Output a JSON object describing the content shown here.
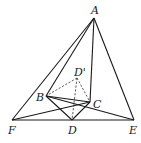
{
  "figure": {
    "type": "geometry-diagram",
    "points": {
      "A": {
        "label": "A",
        "x": 94,
        "y": 18
      },
      "B": {
        "label": "B",
        "x": 46,
        "y": 96
      },
      "C": {
        "label": "C",
        "x": 90,
        "y": 102
      },
      "D_prime": {
        "label": "D'",
        "x": 77,
        "y": 78
      },
      "D": {
        "label": "D",
        "x": 72,
        "y": 120
      },
      "F": {
        "label": "F",
        "x": 12,
        "y": 120
      },
      "E": {
        "label": "E",
        "x": 134,
        "y": 120
      }
    },
    "solid_segments": [
      [
        "A",
        "F"
      ],
      [
        "A",
        "E"
      ],
      [
        "A",
        "B"
      ],
      [
        "A",
        "C"
      ],
      [
        "B",
        "C"
      ],
      [
        "B",
        "D"
      ],
      [
        "C",
        "D"
      ],
      [
        "F",
        "E"
      ],
      [
        "F",
        "C"
      ],
      [
        "B",
        "E"
      ]
    ],
    "dashed_segments": [
      [
        "D_prime",
        "B"
      ],
      [
        "D_prime",
        "C"
      ],
      [
        "D_prime",
        "D"
      ]
    ]
  }
}
